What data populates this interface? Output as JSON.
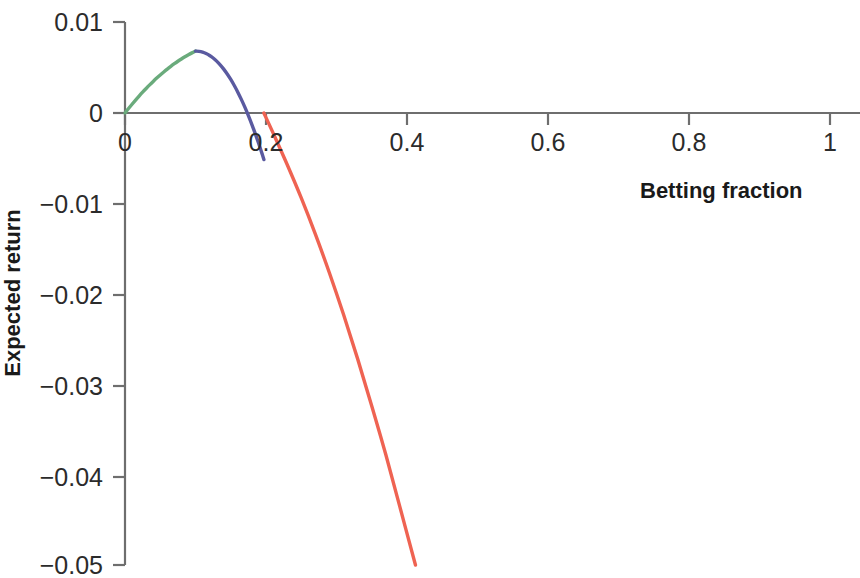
{
  "chart_data": {
    "type": "line",
    "title": "",
    "xlabel": "Betting fraction",
    "ylabel": "Expected return",
    "xlim": [
      0,
      1.05
    ],
    "ylim": [
      -0.05,
      0.01
    ],
    "xticks": [
      "0",
      "0.2",
      "0.4",
      "0.6",
      "0.8",
      "1"
    ],
    "xtick_values": [
      0,
      0.2,
      0.4,
      0.6,
      0.8,
      1
    ],
    "yticks": [
      "0.01",
      "0",
      "−0.01",
      "−0.02",
      "−0.03",
      "−0.04",
      "−0.05"
    ],
    "ytick_values": [
      0.01,
      0,
      -0.01,
      -0.02,
      -0.03,
      -0.04,
      -0.05
    ],
    "grid": false,
    "legend": "none",
    "axis_color": "#6e6e6e",
    "annotations": {
      "peak_x": 0.1,
      "peak_y": 0.005,
      "zero_crossing_x": 0.197,
      "curve_end_x": 0.412,
      "curve_end_y": -0.05
    },
    "series": [
      {
        "name": "rising-segment",
        "color": "#6aab7c",
        "x": [
          0.0,
          0.005,
          0.01,
          0.015,
          0.02,
          0.025,
          0.03,
          0.035,
          0.04,
          0.045,
          0.05,
          0.055,
          0.06,
          0.065,
          0.07,
          0.075,
          0.08,
          0.085,
          0.09,
          0.095,
          0.1
        ],
        "values": [
          0.0,
          0.000492,
          0.000968,
          0.001429,
          0.001873,
          0.002302,
          0.002715,
          0.003112,
          0.003494,
          0.003859,
          0.004209,
          0.004543,
          0.004862,
          0.005164,
          0.005451,
          0.005723,
          0.005978,
          0.006218,
          0.006443,
          0.006651,
          0.006845
        ]
      },
      {
        "name": "falling-positive-segment",
        "color": "#5a5aa0",
        "x": [
          0.1,
          0.105,
          0.11,
          0.115,
          0.12,
          0.125,
          0.13,
          0.135,
          0.14,
          0.145,
          0.15,
          0.155,
          0.16,
          0.165,
          0.17,
          0.175,
          0.18,
          0.185,
          0.19,
          0.195,
          0.197
        ],
        "values": [
          0.006845,
          0.006822,
          0.006735,
          0.006583,
          0.006366,
          0.006085,
          0.005739,
          0.005328,
          0.004853,
          0.004313,
          0.003708,
          0.003039,
          0.002305,
          0.001506,
          0.000643,
          -0.000285,
          -0.001278,
          -0.002336,
          -0.003459,
          -0.004647,
          -0.00515
        ]
      },
      {
        "name": "negative-segment",
        "color": "#ef6352",
        "x": [
          0.197,
          0.21,
          0.23,
          0.25,
          0.27,
          0.29,
          0.31,
          0.33,
          0.35,
          0.37,
          0.39,
          0.412
        ],
        "values": [
          0.0,
          -0.0022,
          -0.0057,
          -0.0094,
          -0.0134,
          -0.0177,
          -0.0223,
          -0.0272,
          -0.0324,
          -0.0378,
          -0.0436,
          -0.05
        ]
      }
    ]
  },
  "axes": {
    "x_tick_labels": [
      "0",
      "0.2",
      "0.4",
      "0.6",
      "0.8",
      "1"
    ],
    "y_tick_labels": [
      "0.01",
      "0",
      "−0.01",
      "−0.02",
      "−0.03",
      "−0.04",
      "−0.05"
    ],
    "x_title": "Betting fraction",
    "y_title": "Expected return"
  }
}
